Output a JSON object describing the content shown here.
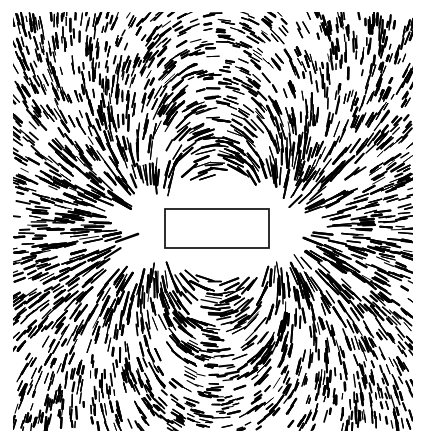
{
  "image": {
    "subject": "Iron filings aligned along the magnetic field of a bar magnet",
    "width": 427,
    "height": 443,
    "background": "#ffffff",
    "ink": "#000000",
    "field_area": {
      "x": 13,
      "y": 12,
      "width": 400,
      "height": 419
    },
    "magnet": {
      "x": 165,
      "y": 209,
      "width": 104,
      "height": 39,
      "stroke": "#1a1a1a",
      "fill": "#ffffff"
    },
    "poles": [
      {
        "x": 165,
        "y": 228
      },
      {
        "x": 269,
        "y": 228
      }
    ],
    "clear_zone": {
      "cx": 217,
      "cy": 228,
      "rx": 120,
      "ry": 62
    }
  }
}
